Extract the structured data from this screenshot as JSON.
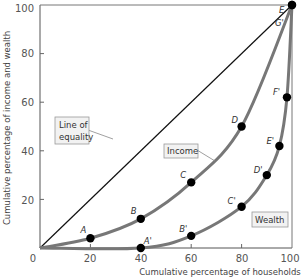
{
  "chart_data": {
    "type": "line",
    "title": "",
    "xlabel": "Cumulative percentage of households",
    "ylabel": "Cumulative percentage of income and wealth",
    "xlim": [
      0,
      100
    ],
    "ylim": [
      0,
      100
    ],
    "x_ticks": [
      "0",
      "20",
      "40",
      "60",
      "80",
      "100"
    ],
    "y_ticks": [
      "20",
      "40",
      "60",
      "80",
      "100"
    ],
    "grid": false,
    "legend": "inline boxed labels",
    "series": [
      {
        "name": "Line of equality",
        "color": "#111111",
        "points": [
          {
            "x": 0,
            "y": 0
          },
          {
            "x": 100,
            "y": 100
          }
        ]
      },
      {
        "name": "Income",
        "color": "#777777",
        "points": [
          {
            "label": "",
            "x": 0,
            "y": 0
          },
          {
            "label": "A",
            "x": 20,
            "y": 4
          },
          {
            "label": "B",
            "x": 40,
            "y": 12
          },
          {
            "label": "C",
            "x": 60,
            "y": 27
          },
          {
            "label": "D",
            "x": 80,
            "y": 50
          },
          {
            "label": "E",
            "x": 100,
            "y": 100
          }
        ]
      },
      {
        "name": "Wealth",
        "color": "#777777",
        "points": [
          {
            "label": "",
            "x": 0,
            "y": 0
          },
          {
            "label": "A'",
            "x": 40,
            "y": 0
          },
          {
            "label": "B'",
            "x": 60,
            "y": 5
          },
          {
            "label": "C'",
            "x": 80,
            "y": 17
          },
          {
            "label": "D'",
            "x": 90,
            "y": 30
          },
          {
            "label": "E'",
            "x": 95,
            "y": 42
          },
          {
            "label": "F'",
            "x": 98,
            "y": 62
          },
          {
            "label": "G'",
            "x": 100,
            "y": 100
          }
        ]
      }
    ],
    "annotations": [
      {
        "text": "Line of equality",
        "lines": [
          "Line of",
          "equality"
        ],
        "target_series": "Line of equality"
      },
      {
        "text": "Income",
        "target_series": "Income"
      },
      {
        "text": "Wealth",
        "target_series": "Wealth"
      }
    ]
  }
}
